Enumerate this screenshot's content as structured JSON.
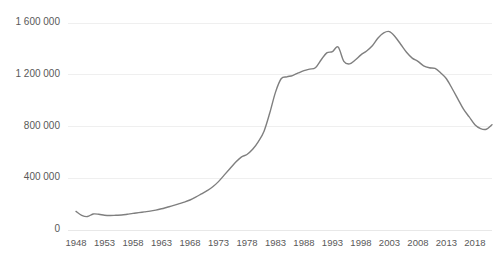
{
  "chart_data": {
    "type": "line",
    "title": "",
    "subtitle": "",
    "xlabel": "",
    "ylabel": "",
    "xlim": [
      1948,
      2021
    ],
    "ylim": [
      0,
      1600000
    ],
    "grid": true,
    "legend_position": "none",
    "line_color": "#7f7f7f",
    "gridline_color": "#efefef",
    "label_color": "#595959",
    "y_ticks": [
      "0",
      "400 000",
      "800 000",
      "1 200 000",
      "1 600 000"
    ],
    "y_tick_values": [
      0,
      400000,
      800000,
      1200000,
      1600000
    ],
    "x_ticks": [
      "1948",
      "1953",
      "1958",
      "1963",
      "1968",
      "1973",
      "1978",
      "1983",
      "1988",
      "1993",
      "1998",
      "2003",
      "2008",
      "2013",
      "2018"
    ],
    "x_tick_values": [
      1948,
      1953,
      1958,
      1963,
      1968,
      1973,
      1978,
      1983,
      1988,
      1993,
      1998,
      2003,
      2008,
      2013,
      2018
    ],
    "series": [
      {
        "name": "series-1",
        "x": [
          1948,
          1949,
          1950,
          1951,
          1952,
          1953,
          1954,
          1955,
          1956,
          1957,
          1958,
          1959,
          1960,
          1961,
          1962,
          1963,
          1964,
          1965,
          1966,
          1967,
          1968,
          1969,
          1970,
          1971,
          1972,
          1973,
          1974,
          1975,
          1976,
          1977,
          1978,
          1979,
          1980,
          1981,
          1982,
          1983,
          1984,
          1985,
          1986,
          1987,
          1988,
          1989,
          1990,
          1991,
          1992,
          1993,
          1994,
          1995,
          1996,
          1997,
          1998,
          1999,
          2000,
          2001,
          2002,
          2003,
          2004,
          2005,
          2006,
          2007,
          2008,
          2009,
          2010,
          2011,
          2012,
          2013,
          2014,
          2015,
          2016,
          2017,
          2018,
          2019,
          2020,
          2021
        ],
        "values": [
          140000,
          110000,
          100000,
          120000,
          118000,
          110000,
          108000,
          110000,
          112000,
          118000,
          125000,
          130000,
          136000,
          142000,
          150000,
          160000,
          172000,
          184000,
          198000,
          212000,
          228000,
          250000,
          275000,
          300000,
          330000,
          370000,
          420000,
          470000,
          520000,
          560000,
          580000,
          620000,
          680000,
          760000,
          900000,
          1060000,
          1165000,
          1180000,
          1190000,
          1210000,
          1228000,
          1240000,
          1250000,
          1310000,
          1365000,
          1375000,
          1410000,
          1300000,
          1280000,
          1310000,
          1350000,
          1380000,
          1420000,
          1480000,
          1520000,
          1530000,
          1490000,
          1430000,
          1370000,
          1325000,
          1300000,
          1265000,
          1250000,
          1245000,
          1210000,
          1165000,
          1090000,
          1010000,
          930000,
          870000,
          810000,
          780000,
          775000,
          810000
        ]
      }
    ]
  },
  "axis": {
    "y_axis_name": "y-axis",
    "x_axis_name": "x-axis"
  }
}
